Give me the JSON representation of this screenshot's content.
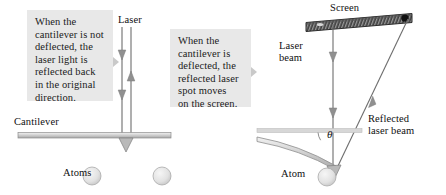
{
  "figure": {
    "domain": "Diagram"
  },
  "panels": {
    "left": {
      "callout_text": "When the\ncantilever is not\ndeflected, the\nlaser light is\nreflected back\nin the original\ndirection.",
      "laser_label": "Laser",
      "cantilever_label": "Cantilever",
      "atoms_label": "Atoms"
    },
    "right": {
      "callout_text": "When the\ncantilever is\ndeflected, the\nreflected laser\nspot moves\non the screen.",
      "screen_label": "Screen",
      "laser_beam_label": "Laser\nbeam",
      "reflected_beam_label": "Reflected\nlaser beam",
      "atom_label": "Atom",
      "angle_label": "θ"
    }
  },
  "colors": {
    "callout_bg": "#e8e8e8",
    "callout_tip": "#c9c9c9",
    "text": "#101010",
    "beam_line": "#6d6d6d",
    "beam_arrow": "#8a8a8a",
    "cantilever_fill": "#cfcfcf",
    "cantilever_edge": "#8d8d8d",
    "atom_fill": "#e3e3e3",
    "atom_edge": "#a9a9a9",
    "screen_dark": "#3a3a3a",
    "screen_hatch": "#8f8f8f",
    "reference_line": "#c2c2c2",
    "spot_light": "#d8d8d8",
    "spot_dark": "#111111",
    "page_bg": "#ffffff"
  },
  "geometry": {
    "left_panel": {
      "incident_beam_x": 122,
      "return_beam_x": 131,
      "beam_top_y": 27,
      "cantilever_y": 135,
      "cantilever_x1": 18,
      "cantilever_x2": 171,
      "tip_x": 126,
      "atom_centers": [
        [
          92,
          176
        ],
        [
          162,
          176
        ]
      ],
      "atom_radius": 9
    },
    "right_panel": {
      "incident_beam_x": 333,
      "beam_top_y": 24,
      "screen_x1": 306,
      "screen_x2": 412,
      "screen_y1": 22,
      "screen_y2": 14,
      "reflected_from": [
        336,
        167
      ],
      "reflected_to": [
        408,
        19
      ],
      "reference_line_y": 131,
      "reference_x1": 310,
      "reference_x2": 360,
      "atom_center": [
        327,
        176
      ],
      "atom_radius": 9,
      "spot_light": [
        318,
        19
      ],
      "spot_dark": [
        406,
        18
      ]
    }
  }
}
